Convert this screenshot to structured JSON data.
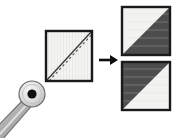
{
  "diagram": {
    "title": "Cutting a fabric square diagonally into two half-square triangle units",
    "background_color": "#ffffff",
    "width": 177,
    "height": 138
  },
  "palette": {
    "white": "#ffffff",
    "fabric_light": "#f2f2f0",
    "fabric_dark": "#4d4d4d",
    "outline_dark": "#1a1a1a",
    "tool_gray": "#b3b3b3",
    "tool_gray_shadow": "#8c8c8c",
    "tool_light": "#e0e0e0",
    "dot_black": "#111111",
    "arrow_black": "#0d0d0d",
    "cut_line": "#3d3d3d"
  },
  "elements": {
    "rotary_cutter": {
      "label": "rotary-cutter",
      "blade_center_x": 32,
      "blade_center_y": 94,
      "blade_radius": 13,
      "hub_radius": 4.5,
      "handle_from_x": 32,
      "handle_from_y": 98,
      "handle_to_x": -6,
      "handle_to_y": 140
    },
    "source_square": {
      "label": "source-fabric-square",
      "x": 46,
      "y": 31,
      "size": 46,
      "fill": "#f2f2f0",
      "border": "#1a1a1a",
      "cut_line_style": "solid-with-parallel-dashed",
      "cut_direction": "bottom-left-to-top-right"
    },
    "arrow": {
      "label": "transform-arrow",
      "direction": "right",
      "x": 98,
      "y": 60,
      "length": 18
    },
    "result_squares": [
      {
        "label": "half-square-triangle-top",
        "x": 122,
        "y": 7,
        "size": 48,
        "upper_left_fill": "#f2f2f0",
        "lower_right_fill": "#4d4d4d"
      },
      {
        "label": "half-square-triangle-bottom",
        "x": 122,
        "y": 62,
        "size": 48,
        "upper_left_fill": "#4d4d4d",
        "lower_right_fill": "#f2f2f0"
      }
    ]
  },
  "text": {
    "caption": ""
  }
}
